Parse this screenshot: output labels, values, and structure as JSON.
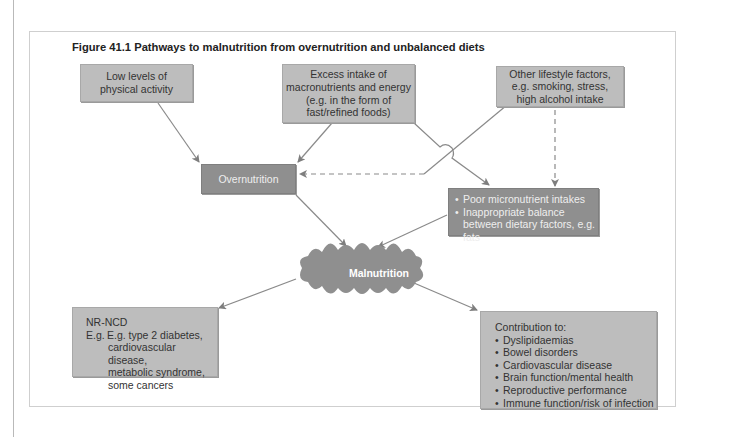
{
  "figure": {
    "title": "Figure 41.1   Pathways to malnutrition from overnutrition and unbalanced diets"
  },
  "nodes": {
    "low_activity": {
      "lines": [
        "Low levels of",
        "physical activity"
      ]
    },
    "excess_intake": {
      "lines": [
        "Excess intake of",
        "macronutrients and energy",
        "(e.g. in the form of",
        "fast/refined foods)"
      ]
    },
    "other_lifestyle": {
      "lines": [
        "Other lifestyle factors,",
        "e.g. smoking, stress,",
        "high alcohol intake"
      ]
    },
    "overnutrition": {
      "label": "Overnutrition"
    },
    "micronutrient": {
      "bullets": [
        "Poor micronutrient intakes",
        "Inappropriate balance between dietary factors, e.g. fats"
      ]
    },
    "malnutrition": {
      "label": "Malnutrition"
    },
    "nrncd": {
      "heading": "NR-NCD",
      "lines": [
        "E.g. type 2 diabetes,",
        "cardiovascular disease,",
        "metabolic syndrome,",
        "some cancers"
      ]
    },
    "contribution": {
      "heading": "Contribution to:",
      "bullets": [
        "Dyslipidaemias",
        "Bowel disorders",
        "Cardiovascular disease",
        "Brain function/mental health",
        "Reproductive performance",
        "Immune function/risk of infection"
      ]
    }
  },
  "colors": {
    "box_fill": "#bdbdbd",
    "dark_fill": "#8f8f8f",
    "arrow": "#8a8a8a"
  }
}
